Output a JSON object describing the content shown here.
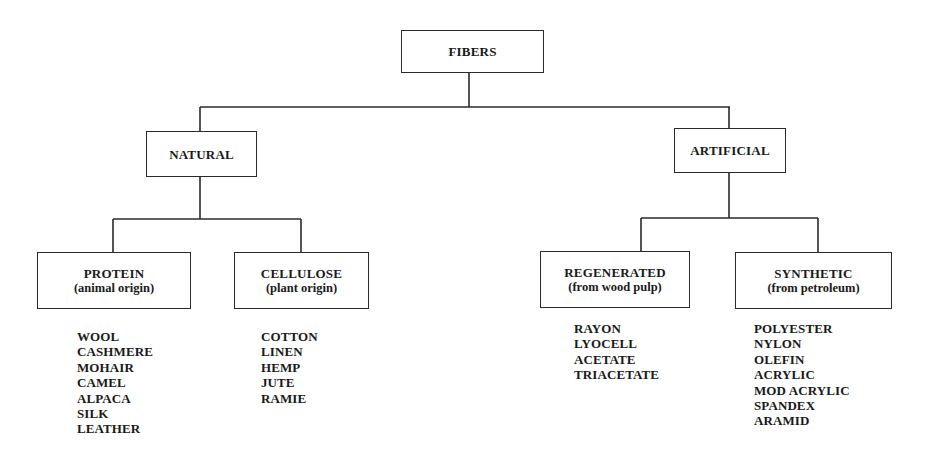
{
  "diagram": {
    "root": {
      "label": "FIBERS"
    },
    "branches": [
      {
        "label": "NATURAL",
        "children": [
          {
            "label": "PROTEIN",
            "sublabel": "(animal origin)",
            "items": [
              "WOOL",
              "CASHMERE",
              "MOHAIR",
              "CAMEL",
              "ALPACA",
              "SILK",
              "LEATHER"
            ]
          },
          {
            "label": "CELLULOSE",
            "sublabel": "(plant origin)",
            "items": [
              "COTTON",
              "LINEN",
              "HEMP",
              "JUTE",
              "RAMIE"
            ]
          }
        ]
      },
      {
        "label": "ARTIFICIAL",
        "children": [
          {
            "label": "REGENERATED",
            "sublabel": "(from wood pulp)",
            "items": [
              "RAYON",
              "LYOCELL",
              "ACETATE",
              "TRIACETATE"
            ]
          },
          {
            "label": "SYNTHETIC",
            "sublabel": "(from petroleum)",
            "items": [
              "POLYESTER",
              "NYLON",
              "OLEFIN",
              "ACRYLIC",
              "MOD ACRYLIC",
              "SPANDEX",
              "ARAMID"
            ]
          }
        ]
      }
    ]
  },
  "colors": {
    "line": "#2a2a2a",
    "text": "#1a1a1a",
    "background": "#ffffff",
    "bleed_through": "#e9e9e9"
  }
}
